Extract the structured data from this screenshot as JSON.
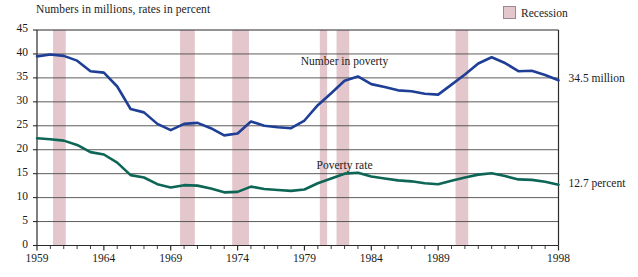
{
  "chart_data": {
    "type": "line",
    "title": "",
    "subtitle": "",
    "axis_note": "Numbers in millions, rates in percent",
    "xlabel": "",
    "ylabel": "",
    "x": [
      1959,
      1960,
      1961,
      1962,
      1963,
      1964,
      1965,
      1966,
      1967,
      1968,
      1969,
      1970,
      1971,
      1972,
      1973,
      1974,
      1975,
      1976,
      1977,
      1978,
      1979,
      1980,
      1981,
      1982,
      1983,
      1984,
      1985,
      1986,
      1987,
      1988,
      1989,
      1990,
      1991,
      1992,
      1993,
      1994,
      1995,
      1996,
      1997,
      1998
    ],
    "xlim": [
      1959,
      1998
    ],
    "ylim": [
      0,
      45
    ],
    "ytick_labels": [
      "0",
      "5",
      "10",
      "15",
      "20",
      "25",
      "30",
      "35",
      "40",
      "45"
    ],
    "yticks": [
      0,
      5,
      10,
      15,
      20,
      25,
      30,
      35,
      40,
      45
    ],
    "xtick_labels": [
      "1959",
      "1964",
      "1969",
      "1974",
      "1979",
      "1984",
      "1989",
      "1998"
    ],
    "xticks": [
      1959,
      1964,
      1969,
      1974,
      1979,
      1984,
      1989,
      1998
    ],
    "grid": true,
    "legend_position": "top-right",
    "series": [
      {
        "name": "Number in poverty",
        "units": "millions",
        "color": "#1f3f96",
        "label_x": 1982.0,
        "label_y": 38.2,
        "end_label": "34.5 million",
        "values": [
          39.5,
          39.9,
          39.6,
          38.6,
          36.4,
          36.1,
          33.2,
          28.5,
          27.8,
          25.4,
          24.1,
          25.4,
          25.6,
          24.5,
          23.0,
          23.4,
          25.9,
          25.0,
          24.7,
          24.5,
          26.1,
          29.3,
          31.8,
          34.4,
          35.3,
          33.7,
          33.1,
          32.4,
          32.2,
          31.7,
          31.5,
          33.6,
          35.7,
          38.0,
          39.3,
          38.1,
          36.4,
          36.5,
          35.6,
          34.5
        ]
      },
      {
        "name": "Poverty rate",
        "units": "percent",
        "color": "#0d6655",
        "label_x": 1982.0,
        "label_y": 16.3,
        "end_label": "12.7 percent",
        "values": [
          22.4,
          22.2,
          21.9,
          21.0,
          19.5,
          19.0,
          17.3,
          14.7,
          14.2,
          12.8,
          12.1,
          12.6,
          12.5,
          11.9,
          11.1,
          11.2,
          12.3,
          11.8,
          11.6,
          11.4,
          11.7,
          13.0,
          14.0,
          15.0,
          15.2,
          14.4,
          14.0,
          13.6,
          13.4,
          13.0,
          12.8,
          13.5,
          14.2,
          14.8,
          15.1,
          14.5,
          13.8,
          13.7,
          13.3,
          12.7
        ]
      }
    ],
    "recessions": [
      {
        "start": 1960.2,
        "end": 1961.15
      },
      {
        "start": 1969.7,
        "end": 1970.8
      },
      {
        "start": 1973.6,
        "end": 1974.85
      },
      {
        "start": 1980.15,
        "end": 1980.7
      },
      {
        "start": 1981.4,
        "end": 1982.35
      },
      {
        "start": 1990.3,
        "end": 1991.25
      }
    ],
    "recession_color": "#e3c7cc"
  },
  "legend": {
    "recession_label": "Recession"
  },
  "colors": {
    "number_in_poverty": "#1f3f96",
    "poverty_rate": "#0d6655",
    "recession": "#e3c7cc",
    "grid": "#4a4a4a",
    "axis": "#2a2a2a"
  }
}
